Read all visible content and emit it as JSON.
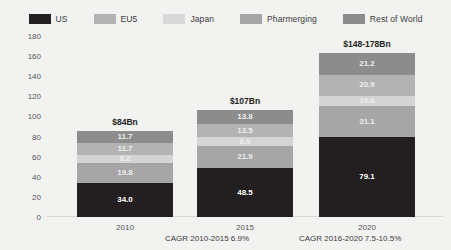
{
  "chart_data": {
    "type": "bar",
    "stacked": true,
    "title": "",
    "xlabel": "",
    "ylabel": "Global Costs US$Bn",
    "ylim": [
      0,
      180
    ],
    "ytick_step": 20,
    "yticks": [
      "180",
      "160",
      "140",
      "120",
      "100",
      "80",
      "60",
      "40",
      "20",
      "0"
    ],
    "grid": false,
    "legend_position": "top",
    "categories": [
      "2010",
      "2015",
      "2020"
    ],
    "bar_totals": [
      "$84Bn",
      "$107Bn",
      "$148-178Bn"
    ],
    "series": [
      {
        "name": "US",
        "color": "#231f20",
        "values": [
          34.0,
          48.5,
          79.1
        ],
        "labels": [
          "34.0",
          "48.5",
          "79.1"
        ]
      },
      {
        "name": "Pharmerging",
        "color": "#a6a6a6",
        "values": [
          19.8,
          21.9,
          31.1
        ],
        "labels": [
          "19.8",
          "21.9",
          "31.1"
        ]
      },
      {
        "name": "Japan",
        "color": "#d4d4d4",
        "values": [
          8.2,
          8.9,
          10.6
        ],
        "labels": [
          "8.2",
          "8.9",
          "10.6"
        ]
      },
      {
        "name": "EU5",
        "color": "#b3b3b3",
        "values": [
          11.7,
          13.5,
          20.9
        ],
        "labels": [
          "11.7",
          "13.5",
          "20.9"
        ]
      },
      {
        "name": "Rest of World",
        "color": "#8c8c8c",
        "values": [
          11.7,
          13.8,
          21.2
        ],
        "labels": [
          "11.7",
          "13.8",
          "21.2"
        ]
      }
    ],
    "stack_order_bottom_to_top": [
      "US",
      "Pharmerging",
      "Japan",
      "EU5",
      "Rest of World"
    ],
    "annotations": [
      {
        "text": "CAGR 2010-2015 6.9%",
        "between": [
          "2010",
          "2015"
        ]
      },
      {
        "text": "CAGR 2016-2020 7.5-10.5%",
        "between": [
          "2015",
          "2020"
        ]
      }
    ]
  },
  "legend": {
    "items": [
      {
        "label": "US",
        "color": "#231f20"
      },
      {
        "label": "EU5",
        "color": "#b3b3b3"
      },
      {
        "label": "Japan",
        "color": "#d9d9d9"
      },
      {
        "label": "Pharmerging",
        "color": "#a6a6a6"
      },
      {
        "label": "Rest of World",
        "color": "#8c8c8c"
      }
    ]
  },
  "background_color": "#f2f2f0"
}
